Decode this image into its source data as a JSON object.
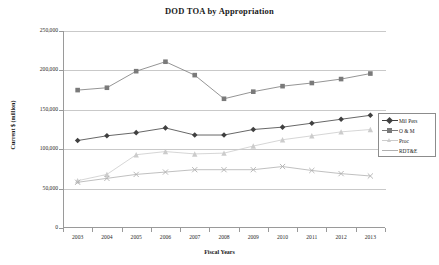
{
  "chart_data": {
    "type": "line",
    "title": "DOD TOA by Appropriation",
    "xlabel": "Fiscal Years",
    "ylabel": "Current $ (million)",
    "categories": [
      "2003",
      "2004",
      "2005",
      "2006",
      "2007",
      "2008",
      "2009",
      "2010",
      "2011",
      "2012",
      "2013"
    ],
    "ylim": [
      0,
      250000
    ],
    "yticks": [
      "0",
      "50,000",
      "100,000",
      "150,000",
      "200,000",
      "250,000"
    ],
    "ytick_values": [
      0,
      50000,
      100000,
      150000,
      200000,
      250000
    ],
    "grid": true,
    "legend_position": "right",
    "series": [
      {
        "name": "Mil Pers",
        "color": "#404040",
        "marker": "diamond",
        "values": [
          111000,
          117000,
          121000,
          127000,
          118000,
          118000,
          125000,
          128000,
          133000,
          138000,
          143000
        ]
      },
      {
        "name": "O & M",
        "color": "#7a7a7a",
        "marker": "square",
        "values": [
          175000,
          178000,
          199000,
          211000,
          194000,
          164000,
          173000,
          180000,
          184000,
          189000,
          196000
        ]
      },
      {
        "name": "Proc",
        "color": "#cccccc",
        "marker": "triangle",
        "values": [
          60000,
          68000,
          93000,
          97000,
          94000,
          95000,
          104000,
          112000,
          117000,
          122000,
          125000
        ]
      },
      {
        "name": "RDT&E",
        "color": "#b0b0b0",
        "marker": "cross",
        "values": [
          58000,
          63000,
          68000,
          71000,
          74000,
          74000,
          74000,
          78000,
          73000,
          69000,
          66000
        ]
      }
    ]
  }
}
